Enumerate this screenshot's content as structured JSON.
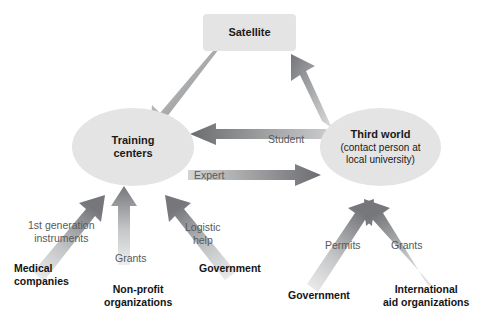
{
  "diagram": {
    "background_color": "#ffffff",
    "node_fill": "#e4e4e4",
    "arrow_color_dark": "#6e7072",
    "arrow_color_light": "#d8d9da",
    "edge_label_color": "#58595b",
    "source_label_color": "#141414"
  },
  "nodes": {
    "satellite": {
      "label": "Satellite",
      "shape": "rounded-rect"
    },
    "training": {
      "label_line1": "Training",
      "label_line2": "centers",
      "shape": "ellipse"
    },
    "third_world": {
      "title": "Third world",
      "sub_line1": "(contact person at",
      "sub_line2": "local university)",
      "shape": "ellipse"
    }
  },
  "edges": [
    {
      "id": "satellite-to-training",
      "label": "",
      "from": "satellite",
      "to": "training"
    },
    {
      "id": "thirdworld-to-satellite",
      "label": "",
      "from": "third_world",
      "to": "satellite"
    },
    {
      "id": "thirdworld-to-training",
      "label": "Student",
      "from": "third_world",
      "to": "training"
    },
    {
      "id": "training-to-thirdworld",
      "label": "Expert",
      "from": "training",
      "to": "third_world"
    },
    {
      "id": "medical-to-training",
      "label_line1": "1st generation",
      "label_line2": "instruments",
      "from": "medical_companies",
      "to": "training"
    },
    {
      "id": "nonprofit-to-training",
      "label": "Grants",
      "from": "non_profit_organizations",
      "to": "training"
    },
    {
      "id": "government-to-training",
      "label_line1": "Logistic",
      "label_line2": "help",
      "from": "government_left",
      "to": "training"
    },
    {
      "id": "government-to-thirdworld",
      "label": "Permits",
      "from": "government_right",
      "to": "third_world"
    },
    {
      "id": "intlaid-to-thirdworld",
      "label": "Grants",
      "from": "international_aid_organizations",
      "to": "third_world"
    }
  ],
  "sources": {
    "medical_companies": {
      "line1": "Medical",
      "line2": "companies"
    },
    "non_profit_organizations": {
      "line1": "Non-profit",
      "line2": "organizations"
    },
    "government_left": {
      "line1": "Government"
    },
    "government_right": {
      "line1": "Government"
    },
    "international_aid_organizations": {
      "line1": "International",
      "line2": "aid organizations"
    }
  }
}
